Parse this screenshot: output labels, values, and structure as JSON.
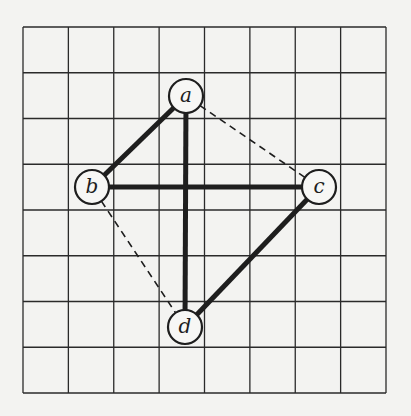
{
  "diagram": {
    "type": "graph-on-grid",
    "width": 411,
    "height": 416,
    "background": "#f3f3f1",
    "grid": {
      "x0": 23,
      "y0": 27,
      "x1": 386,
      "y1": 393,
      "cols": 8,
      "rows": 8,
      "line_color": "#2a2a2a"
    },
    "node_radius": 17,
    "nodes": [
      {
        "id": "a",
        "label": "a",
        "x": 186,
        "y": 96
      },
      {
        "id": "b",
        "label": "b",
        "x": 92,
        "y": 187
      },
      {
        "id": "c",
        "label": "c",
        "x": 319,
        "y": 187
      },
      {
        "id": "d",
        "label": "d",
        "x": 185,
        "y": 327
      }
    ],
    "edges": [
      {
        "from": "a",
        "to": "b",
        "style": "solid"
      },
      {
        "from": "a",
        "to": "d",
        "style": "solid"
      },
      {
        "from": "b",
        "to": "c",
        "style": "solid"
      },
      {
        "from": "c",
        "to": "d",
        "style": "solid"
      },
      {
        "from": "a",
        "to": "c",
        "style": "dashed"
      },
      {
        "from": "b",
        "to": "d",
        "style": "dashed"
      }
    ]
  }
}
